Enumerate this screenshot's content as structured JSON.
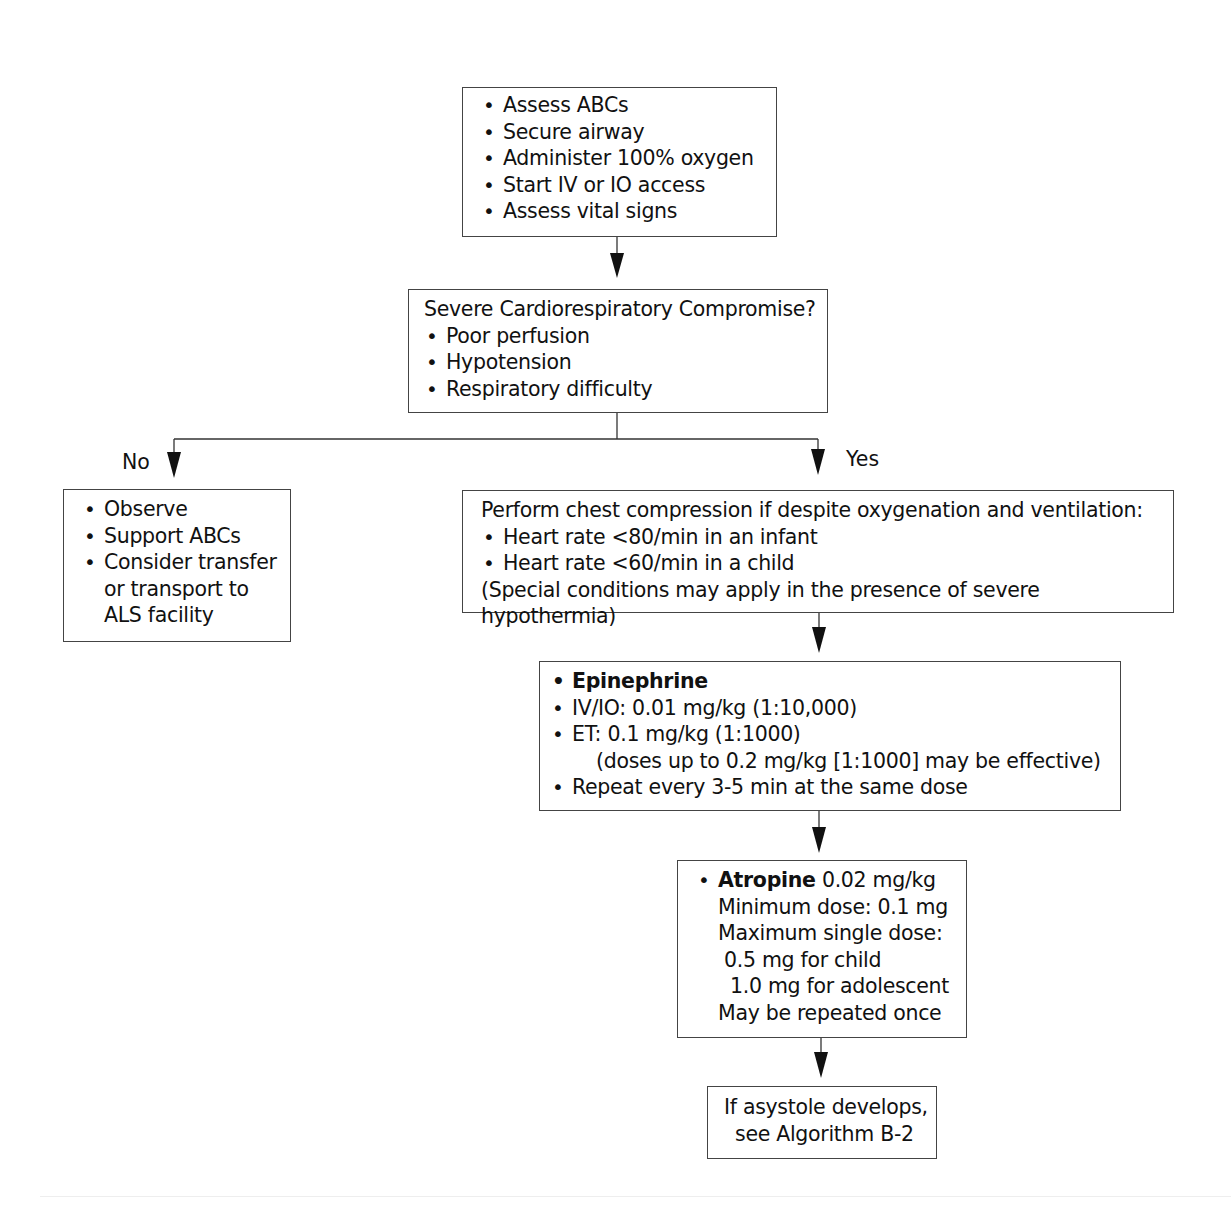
{
  "diagram": {
    "type": "flowchart",
    "nodes": {
      "initial": {
        "items": [
          "Assess ABCs",
          "Secure airway",
          "Administer 100% oxygen",
          "Start IV or IO access",
          "Assess vital signs"
        ]
      },
      "decision": {
        "question": "Severe Cardiorespiratory Compromise?",
        "items": [
          "Poor perfusion",
          "Hypotension",
          "Respiratory difficulty"
        ]
      },
      "no_branch": {
        "items": [
          "Observe",
          "Support ABCs",
          "Consider transfer"
        ],
        "continuation": [
          "or transport to",
          "ALS facility"
        ]
      },
      "compression": {
        "intro": "Perform chest compression if despite oxygenation and ventilation:",
        "items": [
          "Heart rate <80/min in an infant",
          "Heart rate <60/min in a child"
        ],
        "note": "(Special conditions may apply in the presence of severe hypothermia)"
      },
      "epinephrine": {
        "title": "Epinephrine",
        "items": [
          "IV/IO: 0.01 mg/kg (1:10,000)",
          "ET: 0.1 mg/kg (1:1000)"
        ],
        "et_note": "(doses up to 0.2 mg/kg [1:1000] may be effective)",
        "repeat": "Repeat every 3-5 min at the same dose"
      },
      "atropine": {
        "title": "Atropine",
        "dose": " 0.02 mg/kg",
        "min_dose": "Minimum dose: 0.1 mg",
        "max_label": "Maximum single dose:",
        "max_child": "0.5 mg for child",
        "max_adolescent": "1.0 mg for adolescent",
        "repeat": "May be repeated once"
      },
      "asystole": {
        "line1": "If asystole develops,",
        "line2": "see Algorithm B-2"
      }
    },
    "edge_labels": {
      "no": "No",
      "yes": "Yes"
    }
  }
}
